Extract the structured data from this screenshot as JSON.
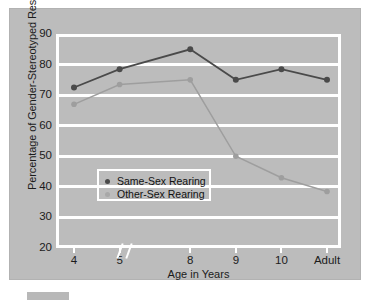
{
  "chart_data": {
    "type": "line",
    "title": "",
    "xlabel": "Age in Years",
    "ylabel": "Percentage of Gender-Stereotyped Responses",
    "categories": [
      "4",
      "5",
      "8",
      "9",
      "10",
      "Adult"
    ],
    "ylim": [
      20,
      90
    ],
    "yticks": [
      20,
      30,
      40,
      50,
      60,
      70,
      80,
      90
    ],
    "grid": true,
    "axis_break_between": [
      "5",
      "8"
    ],
    "legend_position": "inside lower-left",
    "series": [
      {
        "name": "Same-Sex Rearing",
        "color": "#4a4a4a",
        "values": [
          72.5,
          78.5,
          85.0,
          75.0,
          78.5,
          75.0
        ]
      },
      {
        "name": "Other-Sex Rearing",
        "color": "#9e9e9e",
        "values": [
          67.0,
          73.5,
          75.0,
          50.0,
          43.0,
          38.5
        ]
      }
    ]
  },
  "legend": {
    "entries": [
      {
        "label": "Same-Sex Rearing",
        "color": "#4a4a4a"
      },
      {
        "label": "Other-Sex Rearing",
        "color": "#a8a8a8"
      }
    ]
  },
  "colors": {
    "panel_background": "#bcbcbc",
    "page_background": "#ffffff",
    "gridline": "#ffffff",
    "series_dark": "#4a4a4a",
    "series_light": "#a0a0a0",
    "text": "#1b1b1b"
  }
}
